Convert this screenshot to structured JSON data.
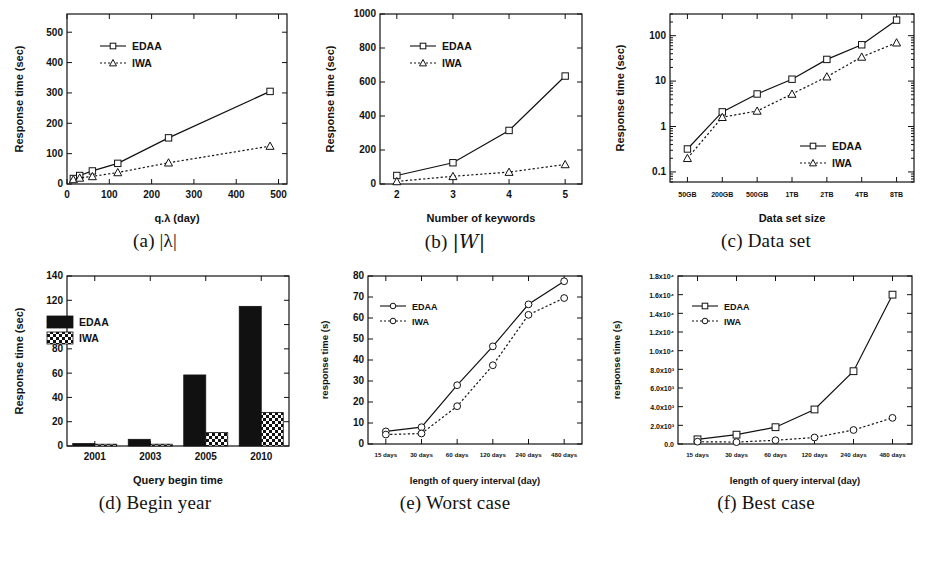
{
  "figure": {
    "panels": [
      {
        "id": "a",
        "caption_prefix": "(a)",
        "caption_text": "|λ|"
      },
      {
        "id": "b",
        "caption_prefix": "(b)",
        "caption_text": "|W|"
      },
      {
        "id": "c",
        "caption_prefix": "(c)",
        "caption_text": "Data set"
      },
      {
        "id": "d",
        "caption_prefix": "(d)",
        "caption_text": "Begin year"
      },
      {
        "id": "e",
        "caption_prefix": "(e)",
        "caption_text": "Worst case"
      },
      {
        "id": "f",
        "caption_prefix": "(f)",
        "caption_text": "Best case"
      }
    ]
  },
  "chart_data": [
    {
      "panel": "a",
      "type": "line",
      "title": "",
      "xlabel": "q.λ (day)",
      "ylabel": "Response time (sec)",
      "x": [
        15,
        30,
        60,
        120,
        240,
        480
      ],
      "xlim": [
        0,
        520
      ],
      "xticks": [
        0,
        100,
        200,
        300,
        400,
        500
      ],
      "xticklabels": [
        "0",
        "100",
        "200",
        "300",
        "400",
        "500"
      ],
      "ylim": [
        0,
        560
      ],
      "yticks": [
        0,
        100,
        200,
        300,
        400,
        500
      ],
      "yticklabels": [
        "0",
        "100",
        "200",
        "300",
        "400",
        "500"
      ],
      "grid": false,
      "legend_position": "upper-left",
      "series": [
        {
          "name": "EDAA",
          "marker": "square",
          "line": "solid",
          "values": [
            18,
            28,
            43,
            68,
            152,
            305
          ]
        },
        {
          "name": "IWA",
          "marker": "triangle",
          "line": "dotted",
          "values": [
            15,
            20,
            25,
            38,
            70,
            125
          ]
        }
      ]
    },
    {
      "panel": "b",
      "type": "line",
      "title": "",
      "xlabel": "Number of keywords",
      "ylabel": "Response time (sec)",
      "x": [
        2,
        3,
        4,
        5
      ],
      "xlim": [
        1.7,
        5.3
      ],
      "xticks": [
        2,
        3,
        4,
        5
      ],
      "xticklabels": [
        "2",
        "3",
        "4",
        "5"
      ],
      "ylim": [
        0,
        1000
      ],
      "yticks": [
        0,
        200,
        400,
        600,
        800,
        1000
      ],
      "yticklabels": [
        "0",
        "200",
        "400",
        "600",
        "800",
        "1000"
      ],
      "grid": false,
      "legend_position": "upper-left",
      "series": [
        {
          "name": "EDAA",
          "marker": "square",
          "line": "solid",
          "values": [
            50,
            125,
            315,
            635
          ]
        },
        {
          "name": "IWA",
          "marker": "triangle",
          "line": "dotted",
          "values": [
            15,
            45,
            70,
            115
          ]
        }
      ]
    },
    {
      "panel": "c",
      "type": "line",
      "title": "",
      "xlabel": "Data set size",
      "ylabel": "Response time (sec)",
      "x": [
        "50GB",
        "200GB",
        "500GB",
        "1TB",
        "2TB",
        "4TB",
        "8TB"
      ],
      "xticklabels": [
        "50GB",
        "200GB",
        "500GB",
        "1TB",
        "2TB",
        "4TB",
        "8TB"
      ],
      "yscale": "log",
      "ylim": [
        0.06,
        300
      ],
      "yticks": [
        0.1,
        1,
        10,
        100
      ],
      "yticklabels": [
        "0.1",
        "1",
        "10",
        "100"
      ],
      "grid": false,
      "legend_position": "lower-right",
      "series": [
        {
          "name": "EDAA",
          "marker": "square",
          "line": "solid",
          "values": [
            0.32,
            2.1,
            5.2,
            11,
            30,
            63,
            220
          ]
        },
        {
          "name": "IWA",
          "marker": "triangle",
          "line": "dotted",
          "values": [
            0.2,
            1.6,
            2.2,
            5.2,
            12.5,
            34,
            70
          ]
        }
      ]
    },
    {
      "panel": "d",
      "type": "bar",
      "title": "",
      "xlabel": "Query begin time",
      "ylabel": "Response time (sec)",
      "categories": [
        "2001",
        "2003",
        "2005",
        "2010"
      ],
      "ylim": [
        0,
        140
      ],
      "yticks": [
        0,
        20,
        40,
        60,
        80,
        100,
        120,
        140
      ],
      "yticklabels": [
        "0",
        "20",
        "40",
        "60",
        "80",
        "100",
        "120",
        "140"
      ],
      "grid": false,
      "legend_position": "upper-left",
      "series": [
        {
          "name": "EDAA",
          "fill": "solid-black",
          "values": [
            2,
            5.5,
            58.5,
            115
          ]
        },
        {
          "name": "IWA",
          "fill": "checker",
          "values": [
            1.5,
            1.5,
            11,
            27.5
          ]
        }
      ]
    },
    {
      "panel": "e",
      "type": "line",
      "title": "",
      "xlabel": "length of query interval (day)",
      "ylabel": "response time (s)",
      "x": [
        "15 days",
        "30 days",
        "60 days",
        "120 days",
        "240 days",
        "480 days"
      ],
      "xticklabels": [
        "15 days",
        "30 days",
        "60 days",
        "120 days",
        "240 days",
        "480 days"
      ],
      "ylim": [
        0,
        80
      ],
      "yticks": [
        0,
        10,
        20,
        30,
        40,
        50,
        60,
        70,
        80
      ],
      "yticklabels": [
        "0",
        "10",
        "20",
        "30",
        "40",
        "50",
        "60",
        "70",
        "80"
      ],
      "grid": false,
      "legend_position": "upper-left",
      "series": [
        {
          "name": "EDAA",
          "marker": "circle",
          "line": "solid",
          "values": [
            6,
            8,
            28,
            46.5,
            66.5,
            77.5
          ]
        },
        {
          "name": "IWA",
          "marker": "circle",
          "line": "dotted",
          "values": [
            4.5,
            5,
            18,
            37.5,
            61.5,
            69.5
          ]
        }
      ]
    },
    {
      "panel": "f",
      "type": "line",
      "title": "",
      "xlabel": "length of query interval (day)",
      "ylabel": "response time (s)",
      "x": [
        "15 days",
        "30 days",
        "60 days",
        "120 days",
        "240 days",
        "480 days"
      ],
      "xticklabels": [
        "15 days",
        "30 days",
        "60 days",
        "120 days",
        "240 days",
        "480 days"
      ],
      "ylim": [
        0,
        18000
      ],
      "yticks": [
        0,
        2000,
        4000,
        6000,
        8000,
        10000,
        12000,
        14000,
        16000,
        18000
      ],
      "yticklabels": [
        "0.0",
        "2.0x10³",
        "4.0x10³",
        "6.0x10³",
        "8.0x10³",
        "1.0x10⁴",
        "1.2x10⁴",
        "1.4x10⁴",
        "1.6x10⁴",
        "1.8x10⁴"
      ],
      "grid": false,
      "legend_position": "upper-left",
      "series": [
        {
          "name": "EDAA",
          "marker": "square",
          "line": "solid",
          "values": [
            500,
            1000,
            1800,
            3700,
            7800,
            16000
          ]
        },
        {
          "name": "IWA",
          "marker": "circle",
          "line": "dotted",
          "values": [
            250,
            200,
            400,
            700,
            1500,
            2800
          ]
        }
      ]
    }
  ]
}
